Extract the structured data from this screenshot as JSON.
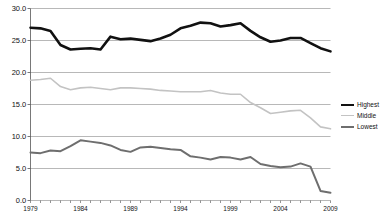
{
  "chart_data": {
    "type": "line",
    "title": "",
    "xlabel": "",
    "ylabel": "",
    "xlim": [
      1979,
      2009
    ],
    "ylim": [
      0.0,
      30.0
    ],
    "grid": true,
    "legend_position": "right",
    "x": [
      1979,
      1980,
      1981,
      1982,
      1983,
      1984,
      1985,
      1986,
      1987,
      1988,
      1989,
      1990,
      1991,
      1992,
      1993,
      1994,
      1995,
      1996,
      1997,
      1998,
      1999,
      2000,
      2001,
      2002,
      2003,
      2004,
      2005,
      2006,
      2007,
      2008,
      2009
    ],
    "xtick_labels": [
      "1979",
      "1984",
      "1989",
      "1994",
      "1999",
      "2004",
      "2009"
    ],
    "xtick_values": [
      1979,
      1984,
      1989,
      1994,
      1999,
      2004,
      2009
    ],
    "ytick_labels": [
      "0.0",
      "5.0",
      "10.0",
      "15.0",
      "20.0",
      "25.0",
      "30.0"
    ],
    "ytick_values": [
      0.0,
      5.0,
      10.0,
      15.0,
      20.0,
      25.0,
      30.0
    ],
    "series": [
      {
        "name": "Highest",
        "color": "#111111",
        "width": 2.6,
        "values": [
          27.0,
          26.9,
          26.5,
          24.3,
          23.6,
          23.7,
          23.8,
          23.6,
          25.6,
          25.2,
          25.3,
          25.1,
          24.9,
          25.3,
          25.9,
          26.9,
          27.3,
          27.8,
          27.7,
          27.2,
          27.4,
          27.7,
          26.5,
          25.5,
          24.8,
          25.0,
          25.4,
          25.4,
          24.6,
          23.8,
          23.3
        ]
      },
      {
        "name": "Middle",
        "color": "#c3c3c3",
        "width": 1.6,
        "values": [
          18.8,
          18.9,
          19.1,
          17.8,
          17.3,
          17.6,
          17.7,
          17.5,
          17.3,
          17.6,
          17.6,
          17.5,
          17.4,
          17.2,
          17.1,
          17.0,
          17.0,
          17.0,
          17.2,
          16.8,
          16.6,
          16.6,
          15.3,
          14.5,
          13.6,
          13.8,
          14.0,
          14.1,
          12.9,
          11.5,
          11.2
        ]
      },
      {
        "name": "Lowest",
        "color": "#6e6e6e",
        "width": 2.0,
        "values": [
          7.5,
          7.4,
          7.8,
          7.7,
          8.5,
          9.4,
          9.2,
          9.0,
          8.6,
          7.9,
          7.6,
          8.3,
          8.4,
          8.2,
          8.0,
          7.9,
          6.9,
          6.7,
          6.4,
          6.8,
          6.7,
          6.4,
          6.8,
          5.7,
          5.4,
          5.2,
          5.3,
          5.8,
          5.3,
          1.5,
          1.2
        ]
      }
    ]
  },
  "legend": {
    "items": [
      {
        "label": "Highest"
      },
      {
        "label": "Middle"
      },
      {
        "label": "Lowest"
      }
    ]
  }
}
